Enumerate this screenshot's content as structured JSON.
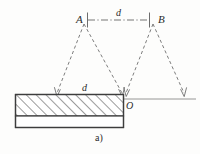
{
  "figure": {
    "caption": "a)",
    "background_color": "#fdfdfc",
    "ink_color": "#4a4a4a",
    "label_color": "#2b2b2b",
    "labels": {
      "point_a": "A",
      "point_b": "B",
      "point_o": "O",
      "spacing_top": "d",
      "spacing_slab": "d"
    },
    "elements": {
      "slab_name": "hatched-slab",
      "top_dimension_name": "dimension-line-ab",
      "left_ray_bundle": "rays-from-a",
      "right_ray_bundle": "rays-from-b",
      "baseline_name": "baseline"
    },
    "geometry": {
      "slab": {
        "x": 15,
        "y": 94,
        "width": 109,
        "height": 34
      },
      "slab_hatch_height": 22,
      "point_a": {
        "x": 84,
        "y": 22
      },
      "point_b": {
        "x": 153,
        "y": 22
      },
      "point_o": {
        "x": 124,
        "y": 99
      },
      "baseline_y": 99,
      "baseline_x_start": 15,
      "baseline_x_end": 196,
      "ray_a_left_foot": {
        "x": 57,
        "y": 96
      },
      "ray_a_right_foot": {
        "x": 122,
        "y": 96
      },
      "ray_b_left_foot": {
        "x": 126,
        "y": 96
      },
      "ray_b_right_foot": {
        "x": 184,
        "y": 96
      }
    }
  }
}
